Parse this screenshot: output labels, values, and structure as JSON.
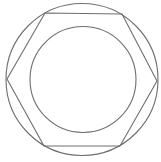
{
  "diagram": {
    "stroke_color": "#6e6e6e",
    "background": "#ffffff",
    "outer_circle": {
      "cx": 82,
      "cy": 79.5,
      "r": 76
    },
    "inner_circle": {
      "cx": 83,
      "cy": 79.5,
      "r": 53
    },
    "hexagon": {
      "points": "7,79 45,13 122,14 157,81 120,146 44,146"
    }
  }
}
